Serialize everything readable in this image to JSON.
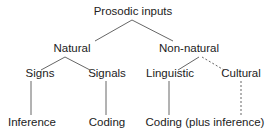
{
  "diagram": {
    "root": {
      "label": "Prosodic inputs"
    },
    "level1": [
      {
        "label": "Natural"
      },
      {
        "label": "Non-natural"
      }
    ],
    "level2": [
      {
        "label": "Signs"
      },
      {
        "label": "Signals"
      },
      {
        "label": "Linguistic"
      },
      {
        "label": "Cultural"
      }
    ],
    "level3": [
      {
        "label": "Inference"
      },
      {
        "label": "Coding"
      },
      {
        "label": "Coding (plus inference)"
      }
    ],
    "colors": {
      "line": "#555555",
      "text": "#222222"
    }
  }
}
